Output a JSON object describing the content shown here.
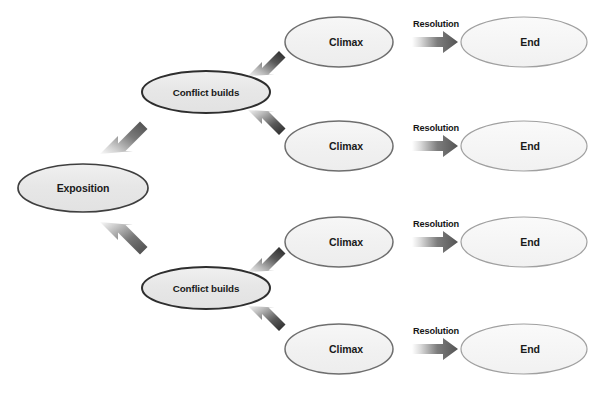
{
  "diagram": {
    "background_color": "#ffffff",
    "node_fill_dark": "#e9e9e9",
    "node_fill_light": "#f2f2f2",
    "node_stroke_dark": "#3a3a3a",
    "node_stroke_light": "#8f8f8f",
    "arrow_dark": "#3a3a3a",
    "arrow_light": "#d8d8d8",
    "text_color": "#1a1a1a",
    "nodes": [
      {
        "id": "exposition",
        "label": "Exposition",
        "cx": 83,
        "cy": 188,
        "rx": 65,
        "ry": 24,
        "emphasis": "strong"
      },
      {
        "id": "conflict-top",
        "label": "Conflict builds",
        "cx": 206,
        "cy": 92,
        "rx": 64,
        "ry": 21,
        "emphasis": "strong"
      },
      {
        "id": "conflict-bottom",
        "label": "Conflict builds",
        "cx": 206,
        "cy": 288,
        "rx": 64,
        "ry": 21,
        "emphasis": "strong"
      },
      {
        "id": "climax-1",
        "label": "Climax",
        "cx": 339,
        "cy": 42,
        "rx": 54,
        "ry": 25,
        "emphasis": "medium"
      },
      {
        "id": "climax-2",
        "label": "Climax",
        "cx": 339,
        "cy": 146,
        "rx": 54,
        "ry": 25,
        "emphasis": "medium"
      },
      {
        "id": "climax-3",
        "label": "Climax",
        "cx": 339,
        "cy": 242,
        "rx": 54,
        "ry": 25,
        "emphasis": "medium"
      },
      {
        "id": "climax-4",
        "label": "Climax",
        "cx": 339,
        "cy": 349,
        "rx": 54,
        "ry": 25,
        "emphasis": "medium"
      },
      {
        "id": "end-1",
        "label": "End",
        "cx": 524,
        "cy": 42,
        "rx": 63,
        "ry": 25,
        "emphasis": "light"
      },
      {
        "id": "end-2",
        "label": "End",
        "cx": 524,
        "cy": 146,
        "rx": 63,
        "ry": 25,
        "emphasis": "light"
      },
      {
        "id": "end-3",
        "label": "End",
        "cx": 524,
        "cy": 242,
        "rx": 63,
        "ry": 25,
        "emphasis": "light"
      },
      {
        "id": "end-4",
        "label": "End",
        "cx": 524,
        "cy": 349,
        "rx": 63,
        "ry": 25,
        "emphasis": "light"
      }
    ],
    "edges": [
      {
        "id": "exposition-to-conflict-top",
        "from": "exposition",
        "to": "conflict-top",
        "label": ""
      },
      {
        "id": "exposition-to-conflict-bottom",
        "from": "exposition",
        "to": "conflict-bottom",
        "label": ""
      },
      {
        "id": "conflict-top-to-climax-1",
        "from": "conflict-top",
        "to": "climax-1",
        "label": ""
      },
      {
        "id": "conflict-top-to-climax-2",
        "from": "conflict-top",
        "to": "climax-2",
        "label": ""
      },
      {
        "id": "conflict-bottom-to-climax-3",
        "from": "conflict-bottom",
        "to": "climax-3",
        "label": ""
      },
      {
        "id": "conflict-bottom-to-climax-4",
        "from": "conflict-bottom",
        "to": "climax-4",
        "label": ""
      },
      {
        "id": "climax-1-to-end-1",
        "from": "climax-1",
        "to": "end-1",
        "label": "Resolution"
      },
      {
        "id": "climax-2-to-end-2",
        "from": "climax-2",
        "to": "end-2",
        "label": "Resolution"
      },
      {
        "id": "climax-3-to-end-3",
        "from": "climax-3",
        "to": "end-3",
        "label": "Resolution"
      },
      {
        "id": "climax-4-to-end-4",
        "from": "climax-4",
        "to": "end-4",
        "label": "Resolution"
      }
    ],
    "labels": {
      "exposition": "Exposition",
      "conflict_builds": "Conflict builds",
      "climax": "Climax",
      "end": "End",
      "resolution": "Resolution"
    }
  }
}
